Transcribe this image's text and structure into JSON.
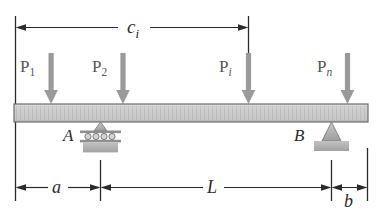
{
  "figure": {
    "background_color": "#ffffff"
  },
  "beam": {
    "name": "beam",
    "fill_color": "#c9c9c9",
    "edge_color": "#6e6e6e",
    "hatch_color": "#b4b4b4"
  },
  "loads": [
    {
      "label": "P",
      "sub": "1",
      "sub_style": "upright",
      "arrow_color": "#9a9a9a",
      "x": 51
    },
    {
      "label": "P",
      "sub": "2",
      "sub_style": "upright",
      "arrow_color": "#9a9a9a",
      "x": 123
    },
    {
      "label": "P",
      "sub": "i",
      "sub_style": "italic",
      "arrow_color": "#9a9a9a",
      "x": 248
    },
    {
      "label": "P",
      "sub": "n",
      "sub_style": "italic",
      "arrow_color": "#9a9a9a",
      "x": 347
    }
  ],
  "supports": [
    {
      "id": "A",
      "label": "A",
      "type": "roller-support",
      "x": 100,
      "roller_count": 4
    },
    {
      "id": "B",
      "label": "B",
      "type": "pin-support",
      "x": 331
    }
  ],
  "dimensions": [
    {
      "id": "ci",
      "label": "c",
      "sub": "i",
      "sub_style": "italic",
      "position": "top",
      "from_x": 15,
      "to_x": 248
    },
    {
      "id": "a",
      "label": "a",
      "sub": "",
      "sub_style": "italic",
      "position": "bottom",
      "from_x": 15,
      "to_x": 100
    },
    {
      "id": "L",
      "label": "L",
      "sub": "",
      "sub_style": "italic",
      "position": "bottom",
      "from_x": 100,
      "to_x": 331
    },
    {
      "id": "b",
      "label": "b",
      "sub": "",
      "sub_style": "italic",
      "position": "bottom",
      "from_x": 331,
      "to_x": 367
    }
  ],
  "colors": {
    "line": "#2b2b2b",
    "load_gray": "#9a9a9a",
    "label_gray": "#6b6b6b",
    "support_fill": "#b0b0b0",
    "support_edge": "#7a7a7a"
  }
}
